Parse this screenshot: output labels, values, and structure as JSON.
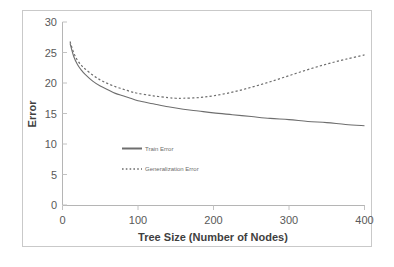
{
  "chart_data": {
    "type": "line",
    "title": "",
    "xlabel": "Tree Size (Number of Nodes)",
    "ylabel": "Error",
    "xlim": [
      0,
      400
    ],
    "ylim": [
      0,
      30
    ],
    "xticks": [
      "0",
      "100",
      "200",
      "300",
      "400"
    ],
    "yticks": [
      "0",
      "5",
      "10",
      "15",
      "20",
      "25",
      "30"
    ],
    "grid": false,
    "legend_position": "inside-lower-left",
    "series": [
      {
        "name": "Train Error",
        "style": "solid",
        "color": "#6e6e6e",
        "x": [
          10,
          15,
          20,
          25,
          30,
          40,
          50,
          60,
          70,
          80,
          90,
          100,
          120,
          140,
          160,
          180,
          200,
          225,
          250,
          275,
          300,
          325,
          350,
          375,
          400
        ],
        "values": [
          26.5,
          24.3,
          23.0,
          22.1,
          21.4,
          20.3,
          19.5,
          18.9,
          18.3,
          17.9,
          17.5,
          17.1,
          16.6,
          16.1,
          15.7,
          15.4,
          15.1,
          14.8,
          14.5,
          14.2,
          14.0,
          13.7,
          13.5,
          13.2,
          13.0
        ]
      },
      {
        "name": "Generalization Error",
        "style": "dotted",
        "color": "#6e6e6e",
        "x": [
          10,
          15,
          20,
          25,
          30,
          40,
          50,
          60,
          70,
          80,
          90,
          100,
          120,
          140,
          150,
          160,
          180,
          200,
          225,
          250,
          275,
          300,
          325,
          350,
          375,
          400
        ],
        "values": [
          26.8,
          24.9,
          23.7,
          22.9,
          22.3,
          21.3,
          20.5,
          19.9,
          19.4,
          19.0,
          18.6,
          18.3,
          17.9,
          17.6,
          17.5,
          17.5,
          17.6,
          17.9,
          18.5,
          19.3,
          20.2,
          21.2,
          22.2,
          23.1,
          23.9,
          24.6
        ]
      }
    ]
  },
  "legend": {
    "items": [
      {
        "label": "Train Error"
      },
      {
        "label": "Generalization Error"
      }
    ]
  }
}
